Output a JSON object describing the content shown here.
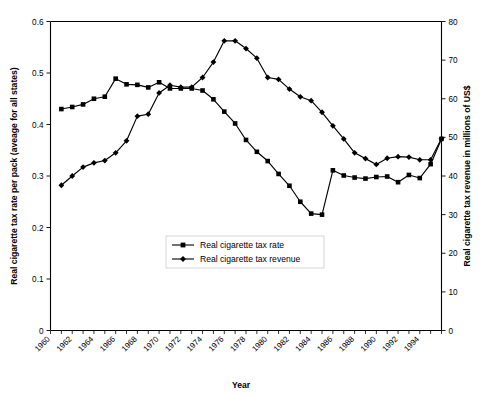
{
  "chart_data": {
    "type": "line",
    "title": "",
    "xlabel": "Year",
    "ylabel": "Real cigarette tax rate per pack (aveage for all states)",
    "y2label": "Real cigarette tax revenue in millions of US$",
    "grid": false,
    "legend_position": "center",
    "xlim": [
      1960,
      1996
    ],
    "ylim": [
      0,
      0.6
    ],
    "y2lim": [
      0,
      80
    ],
    "ytick_labels": [
      "0",
      "0.1",
      "0.2",
      "0.3",
      "0.4",
      "0.5",
      "0.6"
    ],
    "ytick_values": [
      0,
      0.1,
      0.2,
      0.3,
      0.4,
      0.5,
      0.6
    ],
    "y2tick_labels": [
      "0",
      "10",
      "20",
      "30",
      "40",
      "50",
      "60",
      "70",
      "80"
    ],
    "y2tick_values": [
      0,
      10,
      20,
      30,
      40,
      50,
      60,
      70,
      80
    ],
    "xtick_labels": [
      "1960",
      "1962",
      "1964",
      "1966",
      "1968",
      "1970",
      "1972",
      "1974",
      "1976",
      "1978",
      "1980",
      "1982",
      "1984",
      "1986",
      "1988",
      "1990",
      "1992",
      "1994"
    ],
    "xtick_values": [
      1960,
      1962,
      1964,
      1966,
      1968,
      1970,
      1972,
      1974,
      1976,
      1978,
      1980,
      1982,
      1984,
      1986,
      1988,
      1990,
      1992,
      1994
    ],
    "x": [
      1961,
      1962,
      1963,
      1964,
      1965,
      1966,
      1967,
      1968,
      1969,
      1970,
      1971,
      1972,
      1973,
      1974,
      1975,
      1976,
      1977,
      1978,
      1979,
      1980,
      1981,
      1982,
      1983,
      1984,
      1985,
      1986,
      1987,
      1988,
      1989,
      1990,
      1991,
      1992,
      1993,
      1994,
      1995
    ],
    "series": [
      {
        "name": "Real cigarette tax rate",
        "axis": "left",
        "marker": "square",
        "values": [
          0.43,
          0.434,
          0.439,
          0.45,
          0.454,
          0.489,
          0.478,
          0.477,
          0.472,
          0.482,
          0.47,
          0.47,
          0.47,
          0.466,
          0.449,
          0.425,
          0.402,
          0.37,
          0.347,
          0.329,
          0.304,
          0.281,
          0.25,
          0.227,
          0.225,
          0.311,
          0.301,
          0.297,
          0.295,
          0.298,
          0.299,
          0.288,
          0.302,
          0.296,
          0.323
        ]
      },
      {
        "name": "Real cigarette tax revenue",
        "axis": "right",
        "marker": "diamond",
        "values": [
          37.6,
          40.0,
          42.3,
          43.4,
          44.0,
          46.0,
          49.1,
          55.5,
          56.0,
          61.5,
          63.5,
          63.0,
          63.0,
          65.5,
          69.5,
          75.0,
          75.0,
          73.0,
          70.5,
          65.5,
          65.0,
          62.5,
          60.5,
          59.5,
          56.5,
          53.0,
          49.6,
          46.0,
          44.5,
          43.0,
          44.6,
          45.0,
          44.9,
          44.2,
          44.2
        ]
      }
    ],
    "series_tail": {
      "rate_extra_x": [
        1993,
        1994,
        1995,
        1996
      ],
      "rate_extra_values": [
        0.323,
        0.34,
        0.365,
        0.372
      ],
      "revenue_extra_x": [
        1993,
        1994,
        1995,
        1996
      ],
      "revenue_extra_values": [
        44.2,
        44.9,
        49.0,
        49.7
      ]
    }
  },
  "legend": {
    "entries": [
      {
        "label": "Real cigarette tax rate",
        "marker": "square"
      },
      {
        "label": "Real cigarette tax revenue",
        "marker": "diamond"
      }
    ]
  },
  "axes": {
    "x_title": "Year",
    "y_left_title": "Real cigarette tax rate per pack (aveage for all states)",
    "y_right_title": "Real cigarette tax revenue in millions of US$"
  },
  "colors": {
    "line": "#000000",
    "axis": "#000000",
    "background": "#ffffff",
    "legend_border": "#bdbdbd"
  }
}
